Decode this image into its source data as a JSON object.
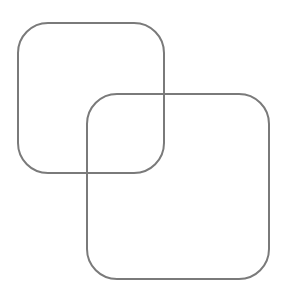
{
  "diagram": {
    "width": 284,
    "height": 296,
    "background": "#ffffff",
    "stroke_color": "#7a7a7a",
    "stroke_width": 2,
    "shapes": [
      {
        "name": "rounded-square-back",
        "type": "rounded-rect",
        "x": 18,
        "y": 23,
        "width": 146,
        "height": 150,
        "corner_radius": 30
      },
      {
        "name": "rounded-square-front",
        "type": "rounded-rect",
        "x": 87,
        "y": 94,
        "width": 182,
        "height": 185,
        "corner_radius": 30
      }
    ]
  }
}
